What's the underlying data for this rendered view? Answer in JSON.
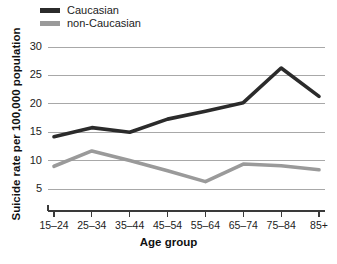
{
  "legend": {
    "position": "top-left",
    "items": [
      {
        "label": "Caucasian",
        "color": "#2b2b2b"
      },
      {
        "label": "non-Caucasian",
        "color": "#9a9a9a"
      }
    ]
  },
  "axes": {
    "xlabel": "Age group",
    "ylabel": "Suicide rate per 100,000 population",
    "yticks": [
      "30",
      "25",
      "20",
      "15",
      "10",
      "5"
    ],
    "xticks": [
      "15–24",
      "25–34",
      "35–44",
      "45–54",
      "55–64",
      "65–74",
      "75–84",
      "85+"
    ]
  },
  "chart_data": {
    "type": "line",
    "title": "",
    "xlabel": "Age group",
    "ylabel": "Suicide rate per 100,000 population",
    "categories": [
      "15–24",
      "25–34",
      "35–44",
      "45–54",
      "55–64",
      "65–74",
      "75–84",
      "85+"
    ],
    "series": [
      {
        "name": "Caucasian",
        "color": "#2b2b2b",
        "values": [
          14.2,
          15.8,
          15.0,
          17.3,
          18.7,
          20.2,
          26.3,
          21.3
        ]
      },
      {
        "name": "non-Caucasian",
        "color": "#9a9a9a",
        "values": [
          9.0,
          11.7,
          10.0,
          8.2,
          6.3,
          9.4,
          9.1,
          8.4
        ]
      }
    ],
    "ylim": [
      2.8,
      31.5
    ],
    "ytick_values": [
      5,
      10,
      15,
      20,
      25,
      30
    ],
    "grid": true,
    "legend_position": "top-left"
  },
  "footer": {
    "cut_off_text": ""
  }
}
